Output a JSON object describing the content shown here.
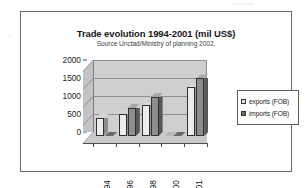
{
  "figure": {
    "title": "Trade evolution 1994-2001 (mil US$)",
    "subtitle": "Source Unctad/Ministry of planning 2002.",
    "frame_color": "#6b6b6b",
    "background_color": "#ffffff"
  },
  "legend": {
    "position": "right",
    "entries": [
      {
        "label": "exports (FOB)",
        "color": "#e8e8e8",
        "icon": "square-swatch-icon"
      },
      {
        "label": "imports (FOB)",
        "color": "#6d6d6d",
        "icon": "square-swatch-icon"
      }
    ]
  },
  "chart_data": {
    "type": "bar",
    "title": "Trade evolution 1994-2001 (mil US$)",
    "subtitle": "Source Unctad/Ministry of planning 2002.",
    "xlabel": "",
    "ylabel": "",
    "ylim": [
      0,
      2000
    ],
    "yticks": [
      0,
      500,
      1000,
      1500,
      2000
    ],
    "ytick_labels": [
      "0",
      "500",
      "1000",
      "1500",
      "2000"
    ],
    "categories": [
      "1994",
      "1996",
      "1998",
      "2000",
      "2001"
    ],
    "grid": true,
    "legend_position": "right",
    "style": "3d-column",
    "series": [
      {
        "name": "exports (FOB)",
        "color": "#ececec",
        "values": [
          500,
          600,
          850,
          0,
          1350
        ]
      },
      {
        "name": "imports (FOB)",
        "color": "#8d8d8d",
        "values": [
          0,
          780,
          1080,
          0,
          1600
        ]
      }
    ]
  }
}
